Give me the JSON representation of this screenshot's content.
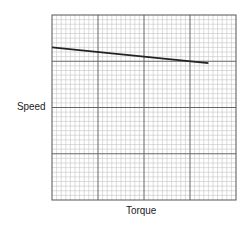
{
  "chart_data": {
    "type": "line",
    "title": "",
    "xlabel": "Torque",
    "ylabel": "Speed",
    "xlim": [
      0,
      40
    ],
    "ylim": [
      0,
      40
    ],
    "grid": true,
    "grid_major_divisions": 4,
    "grid_minor_per_major": 10,
    "tick_labels": false,
    "legend": null,
    "series": [
      {
        "name": "speed-torque",
        "color": "#222222",
        "x": [
          0,
          34
        ],
        "y": [
          33,
          29.6
        ]
      }
    ]
  },
  "labels": {
    "x": "Torque",
    "y": "Speed"
  },
  "colors": {
    "major_grid": "#666666",
    "minor_grid": "#c4c4c4",
    "line": "#222222",
    "frame": "#555555"
  }
}
